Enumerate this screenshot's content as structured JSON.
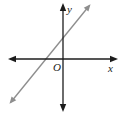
{
  "figure": {
    "type": "coordinate-plane-with-line",
    "background_color": "#ffffff",
    "axes": {
      "color": "#1c1c1c",
      "x_label": "x",
      "y_label": "y",
      "origin_label": "O"
    },
    "line": {
      "color": "#8e8e8e",
      "description": "straight line with positive slope, arrowheads on both ends, crossing the x-axis left of the origin and the y-axis above the origin"
    }
  }
}
